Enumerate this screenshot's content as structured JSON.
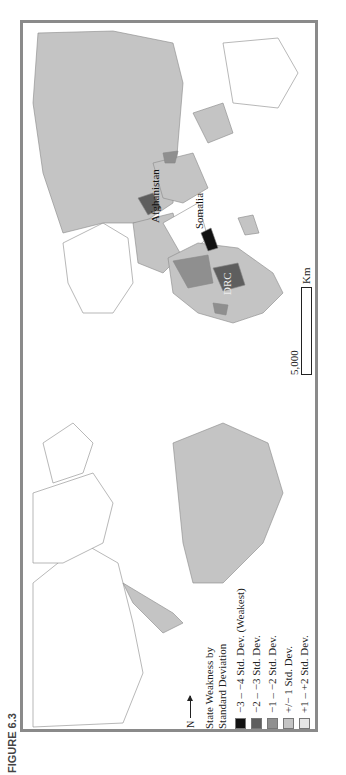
{
  "figure": {
    "caption": "FIGURE 6.3"
  },
  "legend": {
    "title_line1": "State Weakness by",
    "title_line2": "Standard Deviation",
    "items": [
      {
        "label": "−3 – −4 Std. Dev. (Weakest)",
        "color": "#111111"
      },
      {
        "label": "−2 – −3 Std. Dev.",
        "color": "#5e5e5e"
      },
      {
        "label": "−1 – −2 Std. Dev.",
        "color": "#8f8f8f"
      },
      {
        "label": "+/− 1 Std. Dev.",
        "color": "#c4c4c4"
      },
      {
        "label": "+1 – +2 Std. Dev.",
        "color": "#e6e6e6"
      },
      {
        "label": "No data",
        "color": "#ffffff"
      }
    ]
  },
  "north_arrow": {
    "label": "N"
  },
  "scale_bar": {
    "value": "5,000",
    "unit": "Km"
  },
  "annotations": [
    {
      "label": "Afghanistan"
    },
    {
      "label": "Somalia"
    },
    {
      "label": "DRC"
    }
  ],
  "colors": {
    "frame": "#8a8a8a",
    "land_default": "#c4c4c4",
    "no_data": "#ffffff"
  }
}
